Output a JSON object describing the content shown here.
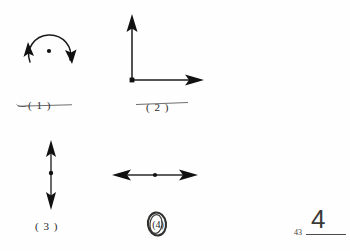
{
  "page": {
    "background_color": "#fefefe",
    "ink_color": "#1a1a1a",
    "pen_color": "#4a4a48"
  },
  "figures": [
    {
      "id": "figure-1",
      "caption": "( 1 )",
      "kind": "circular-double-arrow",
      "description": "circle with a point at its center and two arrowheads on the circumference",
      "center_dot": true,
      "arrowheads": [
        "left-up",
        "right-down"
      ],
      "struck_through": true
    },
    {
      "id": "figure-2",
      "caption": "( 2 )",
      "kind": "perpendicular-axes",
      "description": "two perpendicular arrows emanating from a common origin point, one up one right",
      "origin_dot": true,
      "arrowheads": [
        "up",
        "right"
      ],
      "struck_through": true
    },
    {
      "id": "figure-3",
      "caption": "( 3 )",
      "kind": "vertical-double-arrow",
      "description": "vertical line with arrowheads at both ends and a point at its midpoint",
      "center_dot": true,
      "arrowheads": [
        "up",
        "down"
      ],
      "struck_through": false
    },
    {
      "id": "figure-4",
      "caption": "(4)",
      "kind": "horizontal-double-arrow",
      "description": "horizontal line with arrowheads at both ends and a point at its midpoint",
      "center_dot": true,
      "arrowheads": [
        "left",
        "right"
      ],
      "struck_through": false,
      "caption_handwritten": true
    }
  ],
  "margin_marks": {
    "page_number": "43",
    "handwritten_number": "4"
  }
}
